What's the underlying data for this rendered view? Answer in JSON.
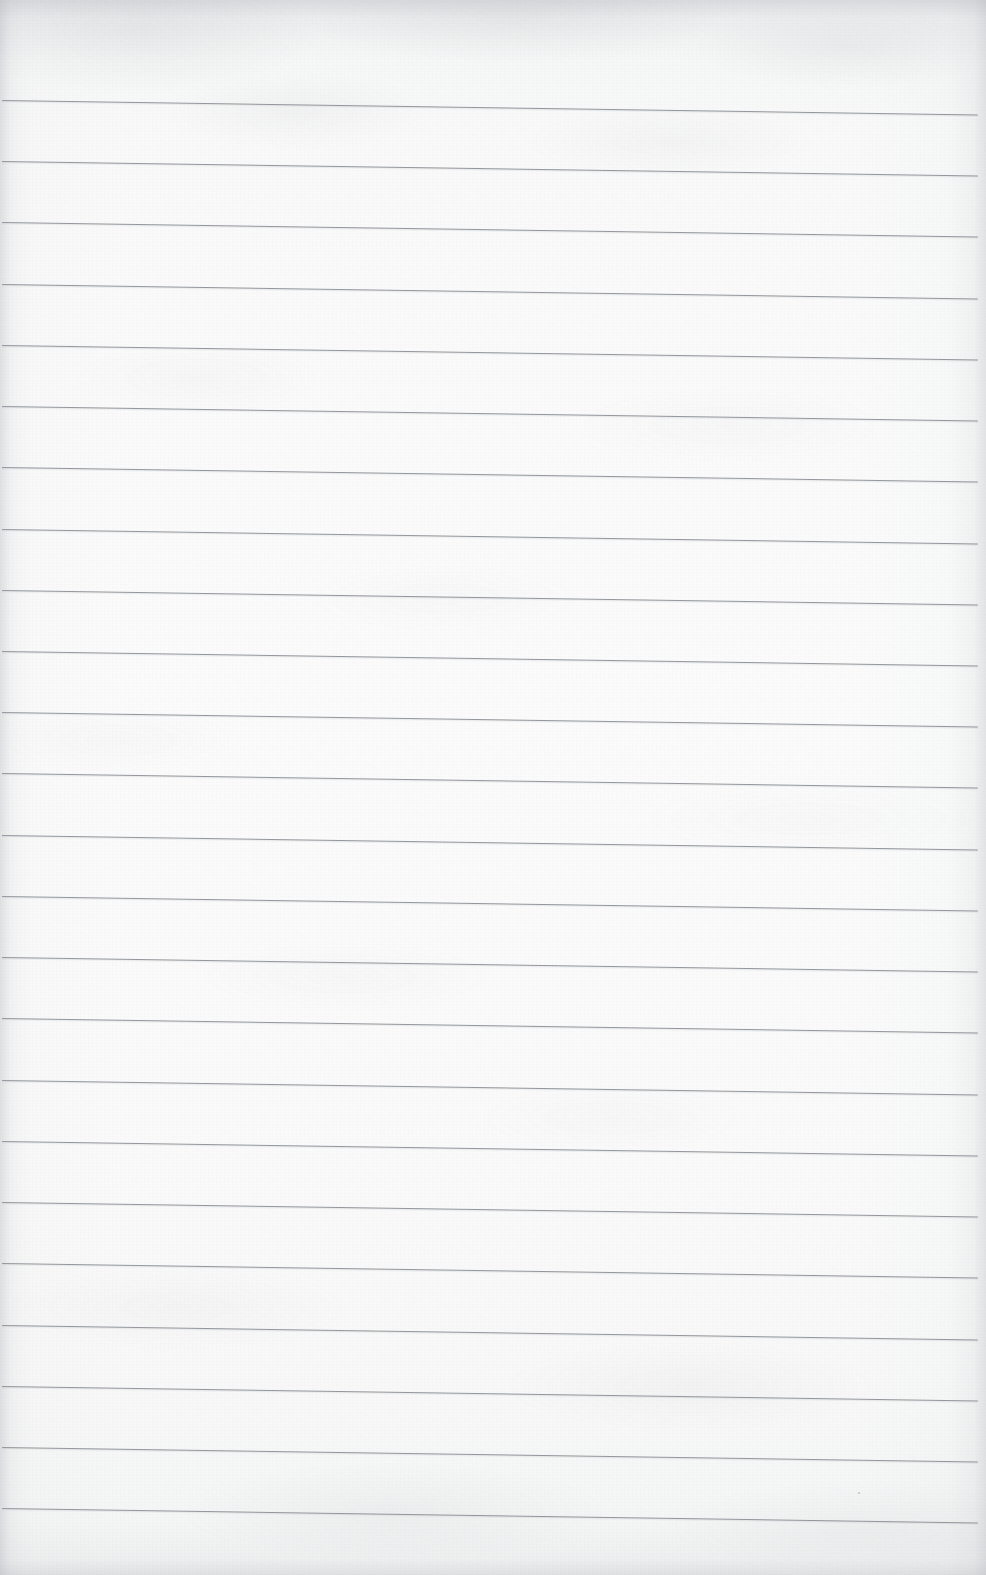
{
  "document": {
    "kind": "scanned-lined-paper",
    "title": "Blank ruled notepad page",
    "width_px": 986,
    "height_px": 1575,
    "text_content": "",
    "has_text": false,
    "has_handwriting": false,
    "has_margin_rule": false,
    "has_holes": false
  },
  "paper": {
    "background_color": "#fcfcfc",
    "tint_top_color": "#f2f3f4",
    "tint_bottom_color": "#f4f5f5",
    "edge_shadow_color": "#a5aaaf",
    "texture": "mottled-scan-grain"
  },
  "rules": {
    "color": "#8b8f94",
    "thickness_px": 1,
    "count": 24,
    "spacing_px": 61.2,
    "first_line_y_px": 100,
    "last_line_y_px": 1508,
    "left_x_px": 2,
    "right_x_px": 978,
    "length_px": 976,
    "tilt_deg": 0.85,
    "tilt_direction": "down-to-the-right",
    "y_positions_left_edge": [
      100,
      161,
      222,
      284,
      345,
      406,
      467,
      529,
      590,
      651,
      712,
      773,
      835,
      896,
      957,
      1018,
      1080,
      1141,
      1202,
      1263,
      1325,
      1386,
      1447,
      1508
    ]
  },
  "specks": [
    {
      "x": 858,
      "y": 1492,
      "size": 2
    },
    {
      "x": 742,
      "y": 1336,
      "size": 1
    }
  ]
}
